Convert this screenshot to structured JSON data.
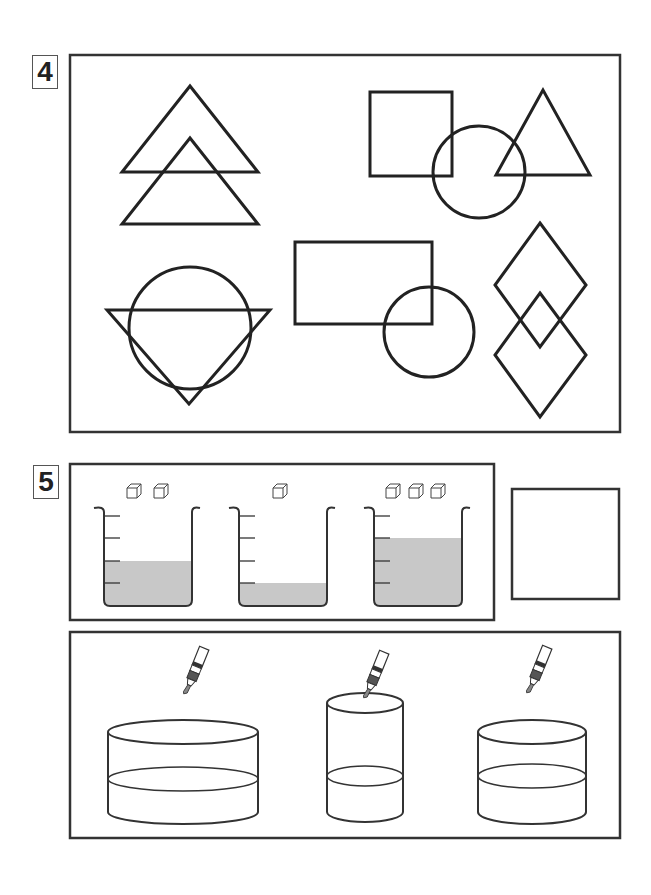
{
  "section4": {
    "label": "4"
  },
  "section5": {
    "label": "5"
  },
  "colors": {
    "stroke": "#222222",
    "liquid": "#c8c8c8",
    "background": "#ffffff"
  },
  "section4_shapes": [
    {
      "name": "two-overlapping-triangles"
    },
    {
      "name": "square-circle-triangle"
    },
    {
      "name": "triangle-over-circle"
    },
    {
      "name": "rectangle-over-circle"
    },
    {
      "name": "two-overlapping-diamonds"
    }
  ],
  "section5_beakers": [
    {
      "cubes": 2,
      "liquid_level_marks": 2.3
    },
    {
      "cubes": 1,
      "liquid_level_marks": 1
    },
    {
      "cubes": 3,
      "liquid_level_marks": 3
    }
  ],
  "section5_cylinders": [
    {
      "dropper": true,
      "shape": "wide"
    },
    {
      "dropper": true,
      "shape": "tall-narrow"
    },
    {
      "dropper": true,
      "shape": "medium"
    }
  ],
  "answer_box": {
    "empty": true
  }
}
